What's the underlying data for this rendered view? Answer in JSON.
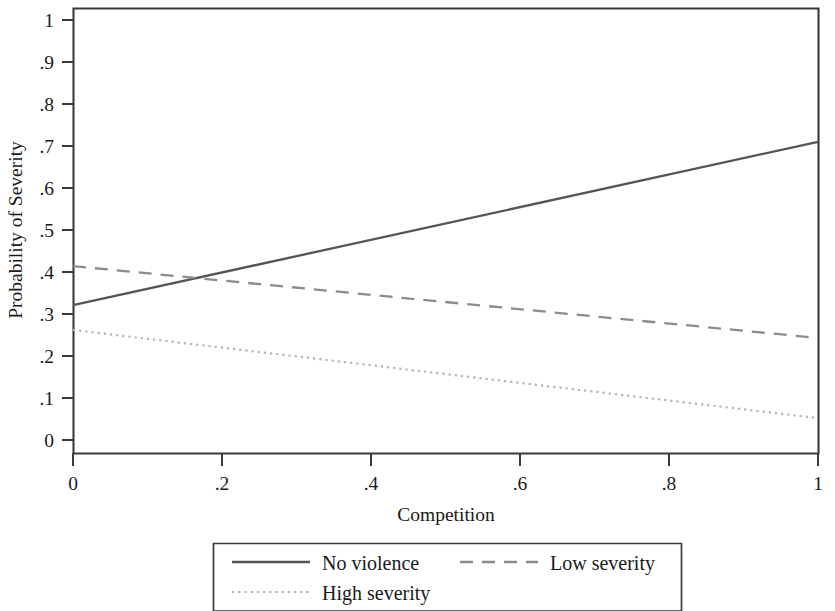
{
  "chart_data": {
    "type": "line",
    "title": "",
    "xlabel": "Competition",
    "ylabel": "Probability of Severity",
    "xlim": [
      0,
      1
    ],
    "ylim": [
      0,
      1
    ],
    "grid": false,
    "legend_position": "bottom",
    "xticks": [
      "0",
      ".2",
      ".4",
      ".6",
      ".8",
      "1"
    ],
    "xtick_values": [
      0,
      0.2,
      0.4,
      0.6,
      0.8,
      1
    ],
    "yticks": [
      "0",
      ".1",
      ".2",
      ".3",
      ".4",
      ".5",
      ".6",
      ".7",
      ".8",
      ".9",
      "1"
    ],
    "ytick_values": [
      0,
      0.1,
      0.2,
      0.3,
      0.4,
      0.5,
      0.6,
      0.7,
      0.8,
      0.9,
      1
    ],
    "x": [
      0,
      1
    ],
    "series": [
      {
        "name": "No violence",
        "style": "solid",
        "color": "#555555",
        "values": [
          0.321,
          0.71
        ]
      },
      {
        "name": "Low severity",
        "style": "dashed",
        "color": "#8c8c8c",
        "values": [
          0.414,
          0.243
        ]
      },
      {
        "name": "High severity",
        "style": "dotted",
        "color": "#b4b4b4",
        "values": [
          0.262,
          0.052
        ]
      }
    ],
    "annotations": [
      {
        "note": "No violence crosses Low severity",
        "x": 0.218,
        "y": 0.398
      }
    ]
  },
  "legend": {
    "entries": [
      {
        "label": "No violence",
        "style": "solid"
      },
      {
        "label": "Low severity",
        "style": "dashed"
      },
      {
        "label": "High severity",
        "style": "dotted"
      }
    ]
  },
  "axes": {
    "x_title": "Competition",
    "y_title": "Probability of Severity"
  }
}
